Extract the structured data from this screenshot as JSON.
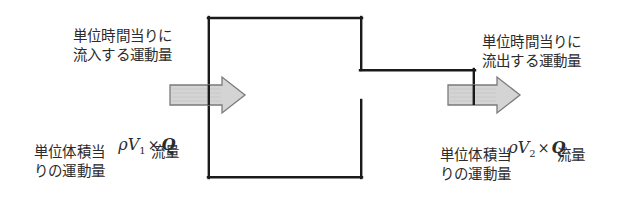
{
  "figure": {
    "background_color": "#ffffff",
    "outline_color": "#1a1a1a",
    "arrow_fill_color": "#d2d2d2",
    "arrow_stroke_color": "#777777",
    "text_color": "#2b2b2b"
  },
  "labels": {
    "inflow": "単位時間当りに\n流入する運動量",
    "outflow": "単位時間当りに\n流出する運動量"
  },
  "formulas": {
    "left": {
      "rho": "ρ",
      "v": "V",
      "sub": "1",
      "times": "×",
      "q": "Q"
    },
    "right": {
      "rho": "ρ",
      "v": "V",
      "sub": "2",
      "times": "×",
      "q": "Q"
    }
  },
  "captions": {
    "left_volume": "単位体積当\nりの運動量",
    "left_flow": "流量",
    "right_volume": "単位体積当\nりの運動量",
    "right_flow": "流量"
  },
  "geometry": {
    "duct": {
      "top_y": 18,
      "bottom_y": 178,
      "left_x": 208,
      "right_x": 362,
      "step_y": 70,
      "step_right_x": 475
    },
    "arrows": [
      {
        "name": "inflow-arrow",
        "x1": 170,
        "x2": 245,
        "y": 95
      },
      {
        "name": "outflow-arrow",
        "x1": 448,
        "x2": 520,
        "y": 95
      }
    ]
  }
}
